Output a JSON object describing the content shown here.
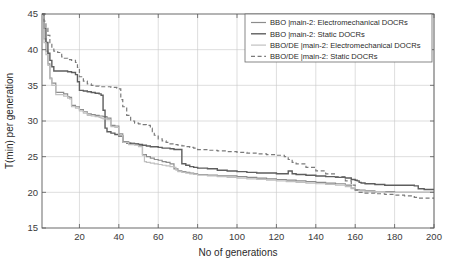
{
  "chart_data": {
    "type": "line",
    "title": "",
    "xlabel": "No of generations",
    "ylabel": "T(min) per generation",
    "xlim": [
      1,
      200
    ],
    "ylim": [
      15,
      45
    ],
    "xticks": [
      20,
      40,
      60,
      80,
      100,
      120,
      140,
      160,
      180,
      200
    ],
    "yticks": [
      15,
      20,
      25,
      30,
      35,
      40,
      45
    ],
    "grid": true,
    "legend_position": "top-right",
    "series": [
      {
        "name": "BBO |main-2: Electromechanical DOCRs",
        "style": "solid",
        "color": "#8c8c8c",
        "width": 1.2,
        "x": [
          1,
          2,
          3,
          4,
          5,
          6,
          8,
          10,
          12,
          14,
          15,
          16,
          18,
          20,
          22,
          24,
          26,
          28,
          30,
          32,
          34,
          36,
          38,
          40,
          42,
          45,
          48,
          50,
          52,
          54,
          56,
          58,
          60,
          62,
          64,
          66,
          68,
          70,
          72,
          74,
          76,
          78,
          80,
          85,
          90,
          95,
          100,
          105,
          110,
          115,
          120,
          125,
          130,
          135,
          140,
          145,
          150,
          155,
          158,
          160,
          162,
          165,
          170,
          175,
          180,
          185,
          190,
          195,
          200
        ],
        "y": [
          45.0,
          41.5,
          39.8,
          38.0,
          36.0,
          35.3,
          34.0,
          34.0,
          33.8,
          33.4,
          33.3,
          32.2,
          32.0,
          31.6,
          31.3,
          31.0,
          30.9,
          30.8,
          30.7,
          30.6,
          30.4,
          29.4,
          29.3,
          28.2,
          27.1,
          26.9,
          26.8,
          26.6,
          25.3,
          25.0,
          24.8,
          24.6,
          24.5,
          24.3,
          24.2,
          24.0,
          23.3,
          23.0,
          22.9,
          22.8,
          22.7,
          22.6,
          22.5,
          22.4,
          22.3,
          22.3,
          22.2,
          22.1,
          22.0,
          21.9,
          21.8,
          21.7,
          21.6,
          21.5,
          21.4,
          21.3,
          21.2,
          21.0,
          20.6,
          20.4,
          20.3,
          20.2,
          20.1,
          20.1,
          20.0,
          20.0,
          20.0,
          20.0,
          20.0
        ]
      },
      {
        "name": "BBO |main-2: Static DOCRs",
        "style": "solid",
        "color": "#5e5e5e",
        "width": 1.4,
        "x": [
          1,
          2,
          3,
          4,
          5,
          6,
          7,
          8,
          10,
          12,
          14,
          16,
          18,
          19,
          20,
          22,
          24,
          26,
          28,
          30,
          31,
          32,
          33,
          34,
          36,
          38,
          40,
          42,
          44,
          46,
          48,
          50,
          52,
          54,
          56,
          58,
          60,
          62,
          64,
          66,
          68,
          70,
          72,
          74,
          76,
          78,
          80,
          85,
          90,
          95,
          100,
          105,
          110,
          115,
          120,
          124,
          126,
          128,
          130,
          135,
          140,
          145,
          150,
          155,
          158,
          160,
          161,
          162,
          163,
          165,
          170,
          175,
          180,
          185,
          190,
          192,
          195,
          200
        ],
        "y": [
          45.0,
          43.0,
          41.0,
          39.5,
          38.5,
          37.6,
          37.0,
          37.0,
          37.0,
          37.0,
          36.9,
          36.8,
          36.5,
          35.5,
          34.3,
          34.2,
          34.1,
          34.0,
          33.9,
          33.8,
          33.6,
          31.5,
          29.0,
          28.5,
          28.3,
          28.1,
          27.9,
          27.0,
          26.9,
          26.8,
          26.8,
          26.7,
          26.6,
          26.5,
          26.4,
          26.4,
          26.3,
          26.2,
          26.2,
          26.1,
          26.0,
          26.0,
          24.0,
          23.8,
          23.6,
          23.5,
          23.4,
          23.3,
          23.1,
          23.0,
          22.9,
          22.8,
          22.7,
          22.7,
          22.6,
          22.6,
          23.0,
          22.6,
          22.5,
          22.4,
          22.3,
          22.2,
          22.1,
          22.0,
          21.8,
          21.7,
          21.6,
          21.4,
          21.3,
          21.2,
          21.1,
          21.0,
          21.0,
          21.0,
          20.9,
          20.5,
          20.4,
          20.4
        ]
      },
      {
        "name": "BBO/DE |main-2: Electromechanical DOCRs",
        "style": "solid",
        "color": "#c0c0c0",
        "width": 1.2,
        "x": [
          1,
          2,
          3,
          4,
          5,
          6,
          8,
          10,
          12,
          14,
          15,
          16,
          18,
          20,
          22,
          24,
          26,
          28,
          30,
          31,
          32,
          34,
          36,
          38,
          40,
          42,
          45,
          48,
          50,
          52,
          53,
          54,
          56,
          58,
          60,
          62,
          64,
          66,
          68,
          69,
          70,
          72,
          74,
          76,
          78,
          80,
          85,
          90,
          95,
          100,
          105,
          110,
          115,
          120,
          125,
          130,
          135,
          140,
          145,
          150,
          155,
          158,
          160,
          162,
          165,
          170,
          175,
          180,
          185,
          190,
          195,
          200
        ],
        "y": [
          45.0,
          41.0,
          39.3,
          37.8,
          35.9,
          35.0,
          33.7,
          33.7,
          33.5,
          33.2,
          33.1,
          32.0,
          31.8,
          31.4,
          31.1,
          30.8,
          30.7,
          30.6,
          30.5,
          30.4,
          30.3,
          30.2,
          29.2,
          29.1,
          28.0,
          27.0,
          26.7,
          26.6,
          26.4,
          25.2,
          24.3,
          24.2,
          24.1,
          24.0,
          23.9,
          23.8,
          23.7,
          23.6,
          23.5,
          23.1,
          22.9,
          22.8,
          22.7,
          22.6,
          22.5,
          22.4,
          22.3,
          22.2,
          22.1,
          22.0,
          21.9,
          21.8,
          21.7,
          21.6,
          21.5,
          21.4,
          21.3,
          21.2,
          21.1,
          21.0,
          20.8,
          20.5,
          20.3,
          20.2,
          20.1,
          20.1,
          20.0,
          20.0,
          20.0,
          20.0,
          20.0,
          20.0
        ]
      },
      {
        "name": "BBO/DE |main-2: Static DOCRs",
        "style": "dashed",
        "color": "#7a7a7a",
        "width": 1.2,
        "x": [
          1,
          2,
          3,
          4,
          5,
          6,
          7,
          8,
          9,
          10,
          11,
          12,
          14,
          16,
          18,
          19,
          20,
          22,
          24,
          26,
          28,
          30,
          32,
          34,
          36,
          38,
          39,
          40,
          41,
          42,
          44,
          46,
          48,
          50,
          52,
          54,
          56,
          57,
          58,
          60,
          62,
          64,
          66,
          68,
          70,
          72,
          74,
          76,
          78,
          80,
          85,
          90,
          95,
          100,
          105,
          110,
          115,
          120,
          124,
          126,
          128,
          130,
          135,
          140,
          145,
          150,
          155,
          158,
          160,
          162,
          165,
          170,
          175,
          180,
          185,
          190,
          192,
          195,
          200
        ],
        "y": [
          45.0,
          44.0,
          43.0,
          42.0,
          41.0,
          40.2,
          39.8,
          39.7,
          39.6,
          39.5,
          39.0,
          38.8,
          38.6,
          38.5,
          38.2,
          37.5,
          36.2,
          35.6,
          35.2,
          35.0,
          34.9,
          34.8,
          34.8,
          34.8,
          34.7,
          34.7,
          34.6,
          34.5,
          33.0,
          32.0,
          30.8,
          30.0,
          29.7,
          29.6,
          29.5,
          29.4,
          29.0,
          28.5,
          28.0,
          27.5,
          27.2,
          27.0,
          26.8,
          26.7,
          26.6,
          26.5,
          26.4,
          26.3,
          26.2,
          26.0,
          25.9,
          25.8,
          25.7,
          25.6,
          25.5,
          25.4,
          25.3,
          25.2,
          25.0,
          24.6,
          24.2,
          24.0,
          23.5,
          23.0,
          22.6,
          22.2,
          21.6,
          21.0,
          20.3,
          20.0,
          19.9,
          19.8,
          19.7,
          19.6,
          19.5,
          19.3,
          19.2,
          19.2,
          19.2
        ]
      }
    ]
  },
  "legend": {
    "entries": [
      "BBO |main-2: Electromechanical DOCRs",
      "BBO |main-2: Static DOCRs",
      "BBO/DE |main-2: Electromechanical DOCRs",
      "BBO/DE |main-2: Static DOCRs"
    ]
  },
  "axes": {
    "x_title": "No of generations",
    "y_title": "T(min) per generation",
    "x_tick_labels": [
      "20",
      "40",
      "60",
      "80",
      "100",
      "120",
      "140",
      "160",
      "180",
      "200"
    ],
    "y_tick_labels": [
      "15",
      "20",
      "25",
      "30",
      "35",
      "40",
      "45"
    ]
  }
}
